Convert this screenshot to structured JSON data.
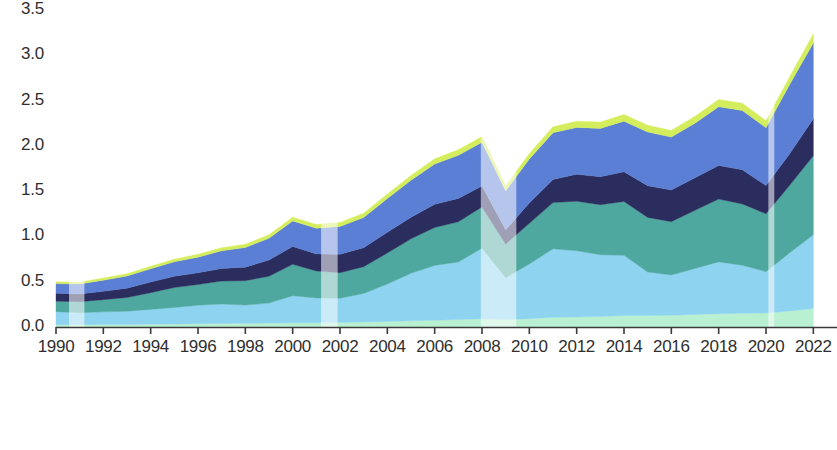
{
  "chart_data": {
    "type": "area",
    "stacked": true,
    "title": "",
    "subtitle": "",
    "xlabel": "",
    "ylabel": "",
    "xlim": [
      1990,
      2023
    ],
    "ylim": [
      0.0,
      3.5
    ],
    "grid": false,
    "legend_position": "bottom",
    "y_ticks": [
      "0.0",
      "0.5",
      "1.0",
      "1.5",
      "2.0",
      "2.5",
      "3.0",
      "3.5"
    ],
    "y_tick_values": [
      0.0,
      0.5,
      1.0,
      1.5,
      2.0,
      2.5,
      3.0,
      3.5
    ],
    "x_ticks": [
      "1990",
      "1992",
      "1994",
      "1996",
      "1998",
      "2000",
      "2002",
      "2004",
      "2006",
      "2008",
      "2010",
      "2012",
      "2014",
      "2016",
      "2018",
      "2020",
      "2022"
    ],
    "x_tick_values": [
      1990,
      1992,
      1994,
      1996,
      1998,
      2000,
      2002,
      2004,
      2006,
      2008,
      2010,
      2012,
      2014,
      2016,
      2018,
      2020,
      2022
    ],
    "x": [
      1990,
      1991,
      1992,
      1993,
      1994,
      1995,
      1996,
      1997,
      1998,
      1999,
      2000,
      2001,
      2002,
      2003,
      2004,
      2005,
      2006,
      2007,
      2008,
      2009,
      2010,
      2011,
      2012,
      2013,
      2014,
      2015,
      2016,
      2017,
      2018,
      2019,
      2020,
      2021,
      2022
    ],
    "series": [
      {
        "name": "Foods, feed, and beverages",
        "color": "#b9f0d2",
        "values": [
          0.025,
          0.026,
          0.028,
          0.028,
          0.031,
          0.033,
          0.036,
          0.039,
          0.041,
          0.043,
          0.046,
          0.046,
          0.049,
          0.056,
          0.062,
          0.069,
          0.075,
          0.082,
          0.09,
          0.082,
          0.092,
          0.108,
          0.11,
          0.116,
          0.126,
          0.128,
          0.13,
          0.139,
          0.147,
          0.151,
          0.155,
          0.178,
          0.203
        ]
      },
      {
        "name": "Industrial supplies and materials",
        "color": "#8ed3f0",
        "values": [
          0.144,
          0.132,
          0.139,
          0.146,
          0.163,
          0.182,
          0.204,
          0.214,
          0.201,
          0.221,
          0.299,
          0.274,
          0.268,
          0.314,
          0.412,
          0.524,
          0.605,
          0.635,
          0.78,
          0.463,
          0.604,
          0.755,
          0.731,
          0.681,
          0.665,
          0.479,
          0.443,
          0.508,
          0.572,
          0.53,
          0.456,
          0.641,
          0.815
        ]
      },
      {
        "name": "Capital goods except automotives",
        "color": "#4fa8a0",
        "values": [
          0.116,
          0.121,
          0.135,
          0.152,
          0.184,
          0.221,
          0.229,
          0.254,
          0.27,
          0.296,
          0.348,
          0.298,
          0.283,
          0.296,
          0.343,
          0.38,
          0.419,
          0.444,
          0.455,
          0.37,
          0.449,
          0.511,
          0.548,
          0.553,
          0.595,
          0.603,
          0.59,
          0.641,
          0.693,
          0.678,
          0.639,
          0.745,
          0.873
        ]
      },
      {
        "name": "Automotive vehicles, parts, and engines",
        "color": "#2b2d5e",
        "values": [
          0.088,
          0.086,
          0.092,
          0.103,
          0.118,
          0.124,
          0.13,
          0.14,
          0.149,
          0.179,
          0.196,
          0.189,
          0.203,
          0.21,
          0.228,
          0.239,
          0.256,
          0.259,
          0.232,
          0.158,
          0.225,
          0.255,
          0.298,
          0.309,
          0.328,
          0.349,
          0.35,
          0.359,
          0.372,
          0.376,
          0.312,
          0.348,
          0.409
        ]
      },
      {
        "name": "Consumer goods (nonfood) excl. auto",
        "color": "#5b7fd4",
        "values": [
          0.106,
          0.109,
          0.123,
          0.134,
          0.147,
          0.16,
          0.172,
          0.194,
          0.217,
          0.241,
          0.282,
          0.284,
          0.308,
          0.334,
          0.373,
          0.408,
          0.444,
          0.475,
          0.482,
          0.429,
          0.485,
          0.516,
          0.517,
          0.534,
          0.558,
          0.594,
          0.584,
          0.603,
          0.648,
          0.654,
          0.638,
          0.766,
          0.837
        ]
      },
      {
        "name": "Other goods",
        "color": "#d4ed5c",
        "values": [
          0.02,
          0.021,
          0.023,
          0.025,
          0.027,
          0.029,
          0.031,
          0.034,
          0.036,
          0.039,
          0.042,
          0.041,
          0.043,
          0.046,
          0.05,
          0.054,
          0.058,
          0.061,
          0.063,
          0.054,
          0.06,
          0.065,
          0.068,
          0.07,
          0.073,
          0.074,
          0.073,
          0.076,
          0.08,
          0.081,
          0.077,
          0.086,
          0.098
        ]
      }
    ],
    "totals": [
      0.499,
      0.495,
      0.54,
      0.588,
      0.67,
      0.749,
      0.802,
      0.875,
      0.914,
      1.019,
      1.213,
      1.132,
      1.154,
      1.256,
      1.468,
      1.674,
      1.857,
      1.956,
      2.102,
      1.556,
      1.915,
      2.21,
      2.272,
      2.263,
      2.345,
      2.227,
      2.17,
      2.326,
      2.512,
      2.47,
      2.277,
      2.764,
      3.235
    ],
    "shaded_regions": [
      {
        "label": "recession",
        "start": 1990.55,
        "end": 1991.2
      },
      {
        "label": "recession",
        "start": 2001.2,
        "end": 2001.9
      },
      {
        "label": "recession",
        "start": 2007.95,
        "end": 2009.45
      },
      {
        "label": "recession",
        "start": 2020.1,
        "end": 2020.35
      }
    ],
    "shading_color": "#ffffff",
    "shading_opacity": 0.55,
    "axis_color": "#3a3a3a"
  },
  "legend": {
    "columns": [
      {
        "items": [
          {
            "label": "Foods, feed, and beverages",
            "color": "#b9f0d2"
          },
          {
            "label": "Capital goods except automotives",
            "color": "#4fa8a0"
          },
          {
            "label": "Consumer goods (nonfood) excl. auto",
            "color": "#5b7fd4"
          }
        ]
      },
      {
        "items": [
          {
            "label": "Industrial supplies and materials",
            "color": "#8ed3f0"
          },
          {
            "label": "Automotive vehicles, parts, and engines",
            "color": "#2b2d5e"
          },
          {
            "label": "Other goods",
            "color": "#d4ed5c"
          }
        ]
      }
    ]
  }
}
